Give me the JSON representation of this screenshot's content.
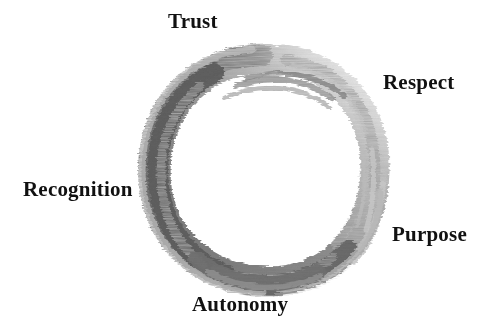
{
  "canvas": {
    "width": 497,
    "height": 333,
    "background_color": "#ffffff"
  },
  "figure": {
    "name": "enso-brush-circle",
    "center_x": 265,
    "center_y": 168,
    "radius": 110,
    "stroke_colors": {
      "dark": "#6b6b6b",
      "mid": "#8a8a8a",
      "light": "#b3b3b3",
      "faint": "#d2d2d2"
    },
    "gap_position": "upper-right"
  },
  "labels": [
    {
      "id": "trust",
      "text": "Trust",
      "position": "top"
    },
    {
      "id": "respect",
      "text": "Respect",
      "position": "upper-right"
    },
    {
      "id": "purpose",
      "text": "Purpose",
      "position": "lower-right"
    },
    {
      "id": "autonomy",
      "text": "Autonomy",
      "position": "bottom"
    },
    {
      "id": "recognition",
      "text": "Recognition",
      "position": "left"
    }
  ],
  "text_color": "#111111"
}
